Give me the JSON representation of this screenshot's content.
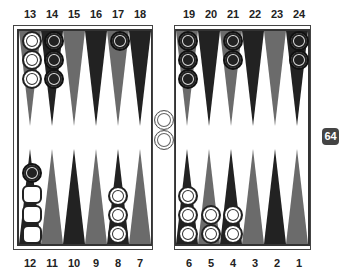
{
  "board": {
    "top_labels": [
      "13",
      "14",
      "15",
      "16",
      "17",
      "18",
      "19",
      "20",
      "21",
      "22",
      "23",
      "24"
    ],
    "bottom_labels": [
      "12",
      "11",
      "10",
      "9",
      "8",
      "7",
      "6",
      "5",
      "4",
      "3",
      "2",
      "1"
    ],
    "colors": {
      "dark_point": "#222222",
      "light_point": "#6b6b6b",
      "white_checker": "#ffffff",
      "black_checker": "#222222",
      "cube": "#444444"
    },
    "points": {
      "13": {
        "white": 3,
        "black": 0
      },
      "14": {
        "white": 0,
        "black": 3
      },
      "17": {
        "white": 0,
        "black": 1
      },
      "19": {
        "white": 0,
        "black": 3
      },
      "21": {
        "white": 0,
        "black": 2
      },
      "24": {
        "white": 0,
        "black": 2
      },
      "12": {
        "white": 0,
        "black": 1,
        "ghost": 3
      },
      "8": {
        "white": 3,
        "black": 0
      },
      "6": {
        "white": 3,
        "black": 0
      },
      "5": {
        "white": 2,
        "black": 0
      },
      "4": {
        "white": 2,
        "black": 0
      }
    },
    "bar": {
      "white": 2,
      "black": 0
    }
  },
  "cube": {
    "value": "64"
  }
}
